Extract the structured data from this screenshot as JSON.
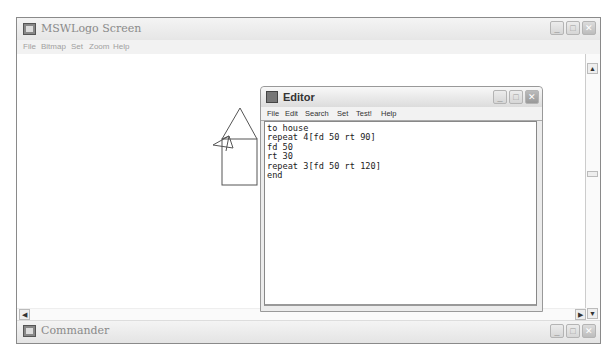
{
  "main_window": {
    "title": "MSWLogo Screen",
    "menu": [
      "File",
      "Bitmap",
      "Set",
      "Zoom",
      "Help"
    ],
    "buttons": {
      "minimize": "_",
      "maximize": "□",
      "close": "✕"
    }
  },
  "editor": {
    "title": "Editor",
    "menu": [
      "File",
      "Edit",
      "Search",
      "Set",
      "Test!",
      "Help"
    ],
    "code": "to house\nrepeat 4[fd 50 rt 90]\nfd 50\nrt 30\nrepeat 3[fd 50 rt 120]\nend"
  },
  "commander": {
    "title": "Commander"
  },
  "scroll": {
    "up": "▲",
    "down": "▼",
    "left": "◀",
    "right": "▶"
  }
}
